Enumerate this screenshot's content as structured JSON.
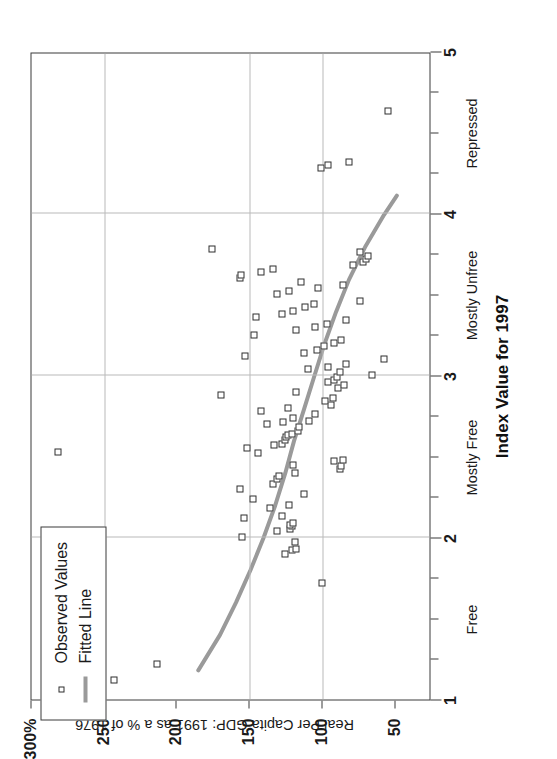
{
  "chart_data": {
    "type": "scatter",
    "title": "",
    "xlabel": "Index Value for 1997",
    "ylabel": "Real Per Capita GDP: 1991 as a % of 1976",
    "xlim": [
      1,
      5
    ],
    "ylim": [
      25,
      300
    ],
    "grid": true,
    "legend_position": "top-left",
    "x_ticks": [
      "1",
      "2",
      "3",
      "4",
      "5"
    ],
    "x_tick_values": [
      1,
      2,
      3,
      4,
      5
    ],
    "x_minor_tick_values": [
      1.25,
      1.5,
      1.75,
      2.25,
      2.5,
      2.75,
      3.25,
      3.5,
      3.75,
      4.25,
      4.5,
      4.75
    ],
    "x_categories": [
      {
        "label": "Free",
        "value": 1.5
      },
      {
        "label": "Mostly Free",
        "value": 2.5
      },
      {
        "label": "Mostly Unfree",
        "value": 3.5
      },
      {
        "label": "Repressed",
        "value": 4.5
      }
    ],
    "y_ticks": [
      "300%",
      "250",
      "200",
      "150",
      "100",
      "50"
    ],
    "y_tick_values": [
      300,
      250,
      200,
      150,
      100,
      50
    ],
    "gridline_x_values": [
      2,
      3,
      4
    ],
    "gridline_y_values": [
      250,
      150,
      100
    ],
    "series": [
      {
        "name": "Observed Values",
        "marker": "open-square",
        "color": "#2e2e2e",
        "points": [
          [
            1.12,
            243
          ],
          [
            1.22,
            214
          ],
          [
            1.72,
            100
          ],
          [
            1.9,
            126
          ],
          [
            1.92,
            121
          ],
          [
            1.93,
            118
          ],
          [
            1.97,
            119
          ],
          [
            2.0,
            155
          ],
          [
            2.04,
            131
          ],
          [
            2.05,
            122
          ],
          [
            2.07,
            121
          ],
          [
            2.08,
            122
          ],
          [
            2.09,
            120
          ],
          [
            2.12,
            154
          ],
          [
            2.13,
            128
          ],
          [
            2.18,
            136
          ],
          [
            2.2,
            123
          ],
          [
            2.24,
            148
          ],
          [
            2.27,
            113
          ],
          [
            2.3,
            157
          ],
          [
            2.33,
            134
          ],
          [
            2.36,
            131
          ],
          [
            2.38,
            130
          ],
          [
            2.4,
            119
          ],
          [
            2.42,
            88
          ],
          [
            2.44,
            87
          ],
          [
            2.45,
            120
          ],
          [
            2.47,
            92
          ],
          [
            2.48,
            86
          ],
          [
            2.52,
            144
          ],
          [
            2.53,
            282
          ],
          [
            2.55,
            152
          ],
          [
            2.57,
            133
          ],
          [
            2.58,
            128
          ],
          [
            2.6,
            126
          ],
          [
            2.62,
            125
          ],
          [
            2.63,
            124
          ],
          [
            2.64,
            121
          ],
          [
            2.66,
            117
          ],
          [
            2.68,
            116
          ],
          [
            2.7,
            138
          ],
          [
            2.71,
            127
          ],
          [
            2.72,
            109
          ],
          [
            2.74,
            120
          ],
          [
            2.76,
            105
          ],
          [
            2.78,
            142
          ],
          [
            2.8,
            124
          ],
          [
            2.82,
            94
          ],
          [
            2.84,
            98
          ],
          [
            2.86,
            93
          ],
          [
            2.88,
            170
          ],
          [
            2.9,
            118
          ],
          [
            2.92,
            89
          ],
          [
            2.94,
            85
          ],
          [
            2.96,
            96
          ],
          [
            2.97,
            92
          ],
          [
            2.99,
            90
          ],
          [
            3.0,
            66
          ],
          [
            3.02,
            88
          ],
          [
            3.04,
            110
          ],
          [
            3.05,
            96
          ],
          [
            3.07,
            84
          ],
          [
            3.1,
            58
          ],
          [
            3.12,
            153
          ],
          [
            3.14,
            113
          ],
          [
            3.16,
            104
          ],
          [
            3.18,
            99
          ],
          [
            3.2,
            92
          ],
          [
            3.22,
            87
          ],
          [
            3.25,
            147
          ],
          [
            3.28,
            118
          ],
          [
            3.3,
            105
          ],
          [
            3.32,
            97
          ],
          [
            3.34,
            84
          ],
          [
            3.36,
            146
          ],
          [
            3.38,
            128
          ],
          [
            3.4,
            120
          ],
          [
            3.42,
            112
          ],
          [
            3.44,
            106
          ],
          [
            3.46,
            74
          ],
          [
            3.5,
            131
          ],
          [
            3.52,
            123
          ],
          [
            3.54,
            103
          ],
          [
            3.56,
            86
          ],
          [
            3.58,
            115
          ],
          [
            3.6,
            157
          ],
          [
            3.62,
            156
          ],
          [
            3.64,
            142
          ],
          [
            3.66,
            134
          ],
          [
            3.68,
            79
          ],
          [
            3.7,
            72
          ],
          [
            3.72,
            70
          ],
          [
            3.74,
            69
          ],
          [
            3.76,
            74
          ],
          [
            3.78,
            176
          ],
          [
            4.28,
            101
          ],
          [
            4.3,
            96
          ],
          [
            4.32,
            82
          ],
          [
            4.63,
            55
          ]
        ]
      }
    ],
    "fitted_line": {
      "name": "Fitted Line",
      "color": "#9a9a9a",
      "width": 4,
      "points": [
        [
          1.18,
          185
        ],
        [
          1.4,
          170
        ],
        [
          1.6,
          159
        ],
        [
          1.8,
          149
        ],
        [
          2.0,
          140
        ],
        [
          2.2,
          132
        ],
        [
          2.4,
          125
        ],
        [
          2.6,
          119
        ],
        [
          2.8,
          112
        ],
        [
          3.0,
          105
        ],
        [
          3.2,
          98
        ],
        [
          3.4,
          90
        ],
        [
          3.6,
          81
        ],
        [
          3.8,
          70
        ],
        [
          4.0,
          57
        ],
        [
          4.12,
          48
        ]
      ]
    },
    "legend": [
      {
        "label": "Observed Values",
        "key": "open-square",
        "color": "#2e2e2e"
      },
      {
        "label": "Fitted Line",
        "key": "line",
        "color": "#9a9a9a"
      }
    ]
  }
}
